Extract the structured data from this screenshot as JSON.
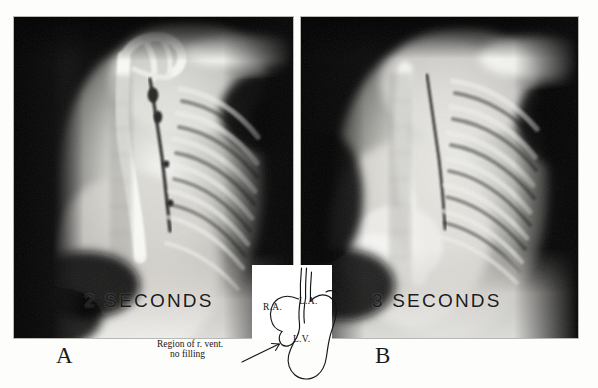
{
  "figure": {
    "kind": "angiocardiogram-radiograph-pair",
    "panels": [
      {
        "letter": "A",
        "timestamp_label": "2 SECONDS",
        "modality": "radiograph"
      },
      {
        "letter": "B",
        "timestamp_label": "3 SECONDS",
        "modality": "radiograph"
      }
    ]
  },
  "inset_diagram": {
    "name": "heart-schematic",
    "chambers": [
      {
        "id": "ra",
        "label": "R.A."
      },
      {
        "id": "la",
        "label": "L.A."
      },
      {
        "id": "lv",
        "label": "L.V."
      }
    ],
    "annotation": {
      "line1": "Region of r. vent.",
      "line2": "no filling",
      "pointer": "arrow"
    }
  },
  "colors": {
    "background": "#fdfdfb",
    "film_dark": "#050505",
    "film_light": "#f2f2ef",
    "ink": "#141414",
    "inset_paper": "#ffffff"
  }
}
